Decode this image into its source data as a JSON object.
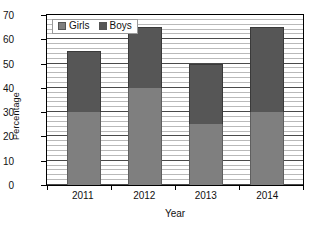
{
  "chart_data": {
    "type": "bar",
    "subtype": "stacked-column",
    "title": "",
    "xlabel": "Year",
    "ylabel": "Percentage",
    "categories": [
      "2011",
      "2012",
      "2013",
      "2014"
    ],
    "series": [
      {
        "name": "Girls",
        "color": "#7f7f7f",
        "values": [
          30,
          40,
          25,
          30
        ]
      },
      {
        "name": "Boys",
        "color": "#565656",
        "values": [
          25,
          25,
          25,
          35
        ]
      }
    ],
    "totals": [
      55,
      65,
      50,
      65
    ],
    "ylim": [
      0,
      70
    ],
    "ytick_step": 10,
    "yticks": [
      0,
      10,
      20,
      30,
      40,
      50,
      60,
      70
    ],
    "ytick_labels": [
      "0",
      "10",
      "20",
      "30",
      "40",
      "50",
      "60",
      "70"
    ],
    "minor_gridline_step": 2,
    "grid": true,
    "grid_axis": "y",
    "legend_position": "top-left",
    "legend_entries": [
      "Girls",
      "Boys"
    ],
    "plot_border": true,
    "background_color": "#ffffff"
  },
  "icons": {
    "girls_swatch": "square-swatch-icon",
    "boys_swatch": "square-swatch-icon"
  }
}
